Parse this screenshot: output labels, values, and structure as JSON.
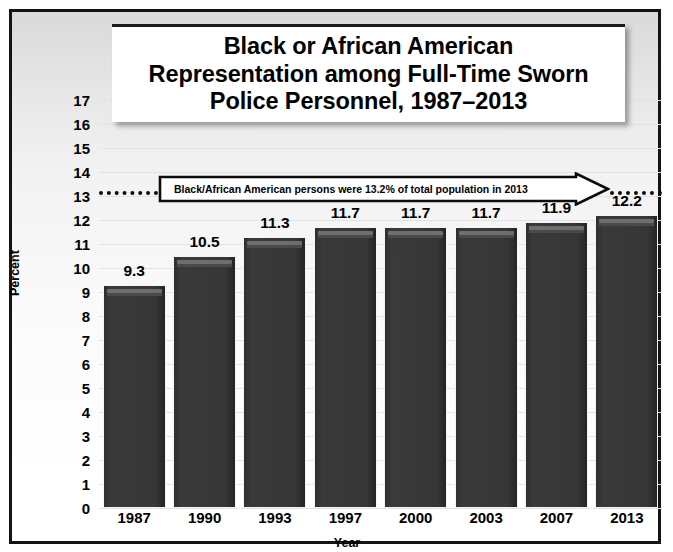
{
  "chart_data": {
    "type": "bar",
    "title": "Black or African American\nRepresentation among Full-Time Sworn\nPolice Personnel, 1987–2013",
    "xlabel": "Year",
    "ylabel": "Percent",
    "categories": [
      "1987",
      "1990",
      "1993",
      "1997",
      "2000",
      "2003",
      "2007",
      "2013"
    ],
    "values": [
      9.3,
      10.5,
      11.3,
      11.7,
      11.7,
      11.7,
      11.9,
      12.2
    ],
    "data_labels": [
      "9.3",
      "10.5",
      "11.3",
      "11.7",
      "11.7",
      "11.7",
      "11.9",
      "12.2"
    ],
    "ylim": [
      0,
      17
    ],
    "yticks": [
      "0",
      "1",
      "2",
      "3",
      "4",
      "5",
      "6",
      "7",
      "8",
      "9",
      "10",
      "11",
      "12",
      "13",
      "14",
      "15",
      "16",
      "17"
    ],
    "grid": true,
    "legend": "none",
    "annotations": [
      {
        "text": "Black/African American persons were 13.2% of total population in 2013",
        "value": 13.2,
        "style": "dotted-line-with-arrow-callout"
      }
    ],
    "colors": {
      "bar": "#363636",
      "bar_highlight": "#6e6e6e",
      "background": "#f2f2f2",
      "gridline": "#e3e3e3",
      "text": "#000000",
      "frame": "#141414",
      "reference_line": "#0d0d0d"
    }
  }
}
